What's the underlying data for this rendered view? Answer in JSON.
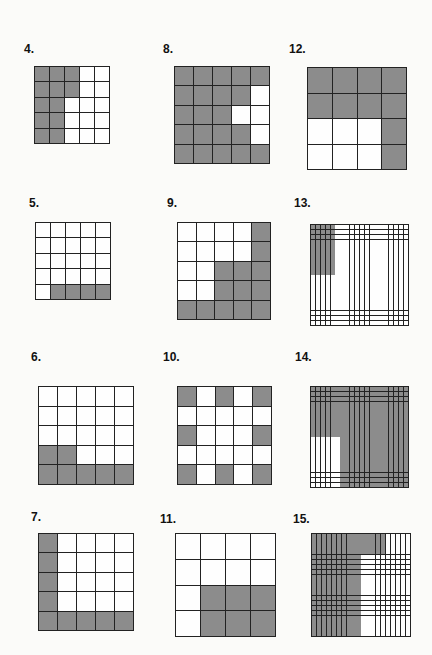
{
  "shade_color": "#8c8c8c",
  "problems": [
    {
      "number": "4.",
      "rows": 5,
      "cols": 5,
      "label_pos": [
        24,
        42
      ],
      "box": [
        34,
        66,
        76,
        78
      ],
      "shaded": [
        "11100",
        "11100",
        "11000",
        "11000",
        "11000"
      ]
    },
    {
      "number": "8.",
      "rows": 5,
      "cols": 5,
      "label_pos": [
        163,
        42
      ],
      "box": [
        174,
        66,
        96,
        98
      ],
      "shaded": [
        "11111",
        "11110",
        "11100",
        "11110",
        "11111"
      ]
    },
    {
      "number": "12.",
      "rows": 4,
      "cols": 4,
      "label_pos": [
        289,
        42
      ],
      "box": [
        307,
        67,
        100,
        103
      ],
      "shaded": [
        "1111",
        "1111",
        "0001",
        "0001"
      ]
    },
    {
      "number": "5.",
      "rows": 5,
      "cols": 5,
      "label_pos": [
        29,
        196
      ],
      "box": [
        35,
        222,
        76,
        78
      ],
      "shaded": [
        "00000",
        "00000",
        "00000",
        "00000",
        "01111"
      ]
    },
    {
      "number": "9.",
      "rows": 5,
      "cols": 5,
      "label_pos": [
        167,
        196
      ],
      "box": [
        177,
        222,
        94,
        98
      ],
      "shaded": [
        "00001",
        "00001",
        "00111",
        "00111",
        "11111"
      ]
    },
    {
      "number": "13.",
      "rows": 20,
      "cols": 20,
      "label_pos": [
        294,
        196
      ],
      "box": [
        310,
        224,
        99,
        102
      ],
      "shaded_rect": {
        "row_start": 0,
        "row_end": 10,
        "col_start": 0,
        "col_end": 5
      },
      "shaded_rect_mode": "shade"
    },
    {
      "number": "6.",
      "rows": 5,
      "cols": 5,
      "label_pos": [
        31,
        350
      ],
      "box": [
        38,
        386,
        96,
        99
      ],
      "shaded": [
        "00000",
        "00000",
        "00000",
        "11000",
        "11111"
      ]
    },
    {
      "number": "10.",
      "rows": 5,
      "cols": 5,
      "label_pos": [
        163,
        350
      ],
      "box": [
        177,
        386,
        95,
        99
      ],
      "shaded": [
        "10101",
        "00000",
        "10001",
        "00000",
        "10101"
      ]
    },
    {
      "number": "14.",
      "rows": 20,
      "cols": 20,
      "label_pos": [
        295,
        350
      ],
      "box": [
        310,
        386,
        99,
        102
      ],
      "shaded_rect": {
        "row_start": 10,
        "row_end": 20,
        "col_start": 0,
        "col_end": 6
      },
      "shaded_rect_mode": "unshade"
    },
    {
      "number": "7.",
      "rows": 5,
      "cols": 5,
      "label_pos": [
        31,
        510
      ],
      "box": [
        38,
        533,
        96,
        98
      ],
      "shaded": [
        "10000",
        "10000",
        "10000",
        "10000",
        "11111"
      ]
    },
    {
      "number": "11.",
      "rows": 4,
      "cols": 4,
      "label_pos": [
        160,
        512
      ],
      "box": [
        175,
        533,
        101,
        104
      ],
      "shaded": [
        "0000",
        "0000",
        "0111",
        "0111"
      ]
    },
    {
      "number": "15.",
      "rows": 20,
      "cols": 20,
      "label_pos": [
        293,
        512
      ],
      "box": [
        311,
        533,
        100,
        104
      ],
      "shaded_regions": [
        {
          "row_start": 0,
          "row_end": 20,
          "col_start": 0,
          "col_end": 10
        },
        {
          "row_start": 0,
          "row_end": 4,
          "col_start": 10,
          "col_end": 15
        }
      ]
    }
  ]
}
